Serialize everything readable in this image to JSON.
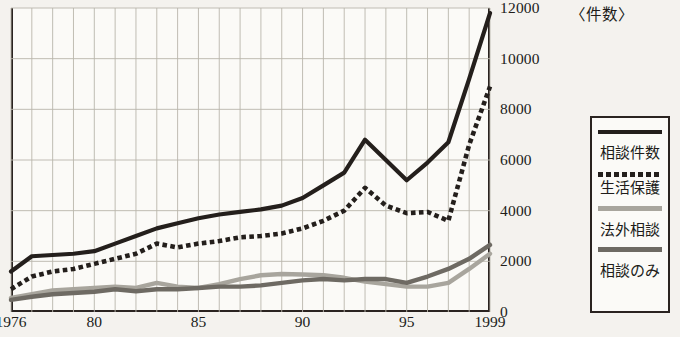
{
  "chart_data": {
    "type": "line",
    "title": "",
    "unit_label": "〈件数〉",
    "xlabel": "",
    "ylabel": "",
    "ylim": [
      0,
      12000
    ],
    "xlim": [
      1976,
      1999
    ],
    "grid": true,
    "legend_position": "right",
    "y_ticks": [
      0,
      2000,
      4000,
      6000,
      8000,
      10000,
      12000
    ],
    "y_tick_labels": [
      "0",
      "2000",
      "4000",
      "6000",
      "8000",
      "10000",
      "12000"
    ],
    "x_ticks": [
      1976,
      1980,
      1985,
      1990,
      1995,
      1999
    ],
    "x_tick_labels": [
      "1976",
      "80",
      "85",
      "90",
      "95",
      "1999"
    ],
    "x": [
      1976,
      1977,
      1978,
      1979,
      1980,
      1981,
      1982,
      1983,
      1984,
      1985,
      1986,
      1987,
      1988,
      1989,
      1990,
      1991,
      1992,
      1993,
      1994,
      1995,
      1996,
      1997,
      1998,
      1999
    ],
    "series": [
      {
        "name": "相談件数",
        "style": "solid",
        "color": "#241f1c",
        "values": [
          1600,
          2200,
          2250,
          2300,
          2400,
          2700,
          3000,
          3300,
          3500,
          3700,
          3850,
          3950,
          4050,
          4200,
          4500,
          5000,
          5500,
          6800,
          6000,
          5200,
          5900,
          6700,
          9200,
          11800
        ]
      },
      {
        "name": "生活保護",
        "style": "dotted",
        "color": "#241f1c",
        "values": [
          900,
          1400,
          1600,
          1700,
          1900,
          2100,
          2300,
          2700,
          2550,
          2700,
          2800,
          2950,
          3000,
          3100,
          3300,
          3600,
          4000,
          4900,
          4200,
          3900,
          3950,
          3600,
          6600,
          8900
        ]
      },
      {
        "name": "法外相談",
        "style": "solid",
        "color": "#a8a59d",
        "values": [
          560,
          700,
          850,
          900,
          950,
          1000,
          950,
          1150,
          1000,
          950,
          1100,
          1300,
          1450,
          1500,
          1480,
          1450,
          1350,
          1200,
          1100,
          1000,
          1000,
          1150,
          1700,
          2300
        ]
      },
      {
        "name": "相談のみ",
        "style": "solid",
        "color": "#6e6a63",
        "values": [
          480,
          600,
          700,
          750,
          800,
          900,
          820,
          900,
          900,
          950,
          1000,
          1000,
          1050,
          1150,
          1250,
          1300,
          1250,
          1300,
          1300,
          1150,
          1400,
          1700,
          2100,
          2650
        ]
      }
    ]
  },
  "legend": {
    "items": [
      {
        "label": "相談件数",
        "swatch": "solid-black"
      },
      {
        "label": "生活保護",
        "swatch": "dotted-black"
      },
      {
        "label": "法外相談",
        "swatch": "solid-light-gray"
      },
      {
        "label": "相談のみ",
        "swatch": "solid-dark-gray"
      }
    ]
  }
}
